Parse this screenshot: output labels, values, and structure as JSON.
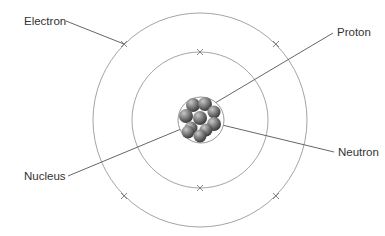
{
  "diagram": {
    "type": "atom-model",
    "labels": {
      "electron": "Electron",
      "proton": "Proton",
      "neutron": "Neutron",
      "nucleus": "Nucleus"
    },
    "colors": {
      "orbit": "#9a9a9a",
      "leader": "#555555",
      "text": "#333333",
      "particle_light": "#b5b5b5",
      "particle_dark": "#4a4a4a"
    },
    "center": [
      201,
      120
    ],
    "orbits": [
      {
        "name": "inner-orbit",
        "radius": 68,
        "electrons": [
          [
            200,
            52
          ],
          [
            200,
            188
          ]
        ]
      },
      {
        "name": "outer-orbit",
        "radius": 107,
        "electrons": [
          [
            124,
            44
          ],
          [
            276,
            44
          ],
          [
            124,
            196
          ],
          [
            276,
            196
          ]
        ]
      }
    ],
    "nucleus_radius": 22
  }
}
